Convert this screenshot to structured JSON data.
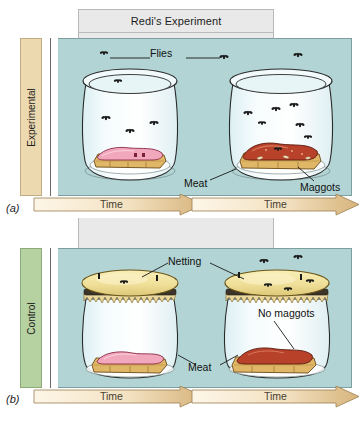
{
  "figure": {
    "title": "Redi's Experiment",
    "panels": [
      {
        "id": "a",
        "caption": "(a)",
        "side_label": "Experimental",
        "side_color": "#ecd9b0",
        "labels": {
          "flies": "Flies",
          "meat": "Meat",
          "maggots": "Maggots"
        },
        "time_left": "Time",
        "time_right": "Time",
        "jars": [
          {
            "position": "left",
            "covered": false,
            "meat_state": "fresh",
            "meat_color": "#f2a8bc",
            "flies_inside": 4,
            "maggots": false
          },
          {
            "position": "right",
            "covered": false,
            "meat_state": "rotting",
            "meat_color": "#b8412a",
            "flies_inside": 7,
            "maggots": true
          }
        ]
      },
      {
        "id": "b",
        "caption": "(b)",
        "side_label": "Control",
        "side_color": "#b6d2a0",
        "labels": {
          "netting": "Netting",
          "meat": "Meat",
          "no_maggots": "No maggots"
        },
        "time_left": "Time",
        "time_right": "Time",
        "jars": [
          {
            "position": "left",
            "covered": true,
            "netting_color": "#f0e2a8",
            "meat_state": "fresh",
            "meat_color": "#f2a8bc",
            "flies_inside": 0,
            "maggots": false
          },
          {
            "position": "right",
            "covered": true,
            "netting_color": "#f0e2a8",
            "meat_state": "rotting",
            "meat_color": "#b8412a",
            "flies_inside": 0,
            "maggots": false
          }
        ]
      }
    ],
    "colors": {
      "scene_background": "#b2d4d4",
      "title_background": "#e9e9e9",
      "arrow_fill_light": "#fdf4e2",
      "arrow_fill_dark": "#d9b87e",
      "bread_color": "#e0b767",
      "glass_color": "#eef7f9"
    }
  }
}
